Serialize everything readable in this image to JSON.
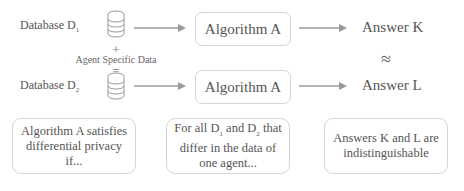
{
  "diagram": {
    "row1": {
      "database_label": "Database D",
      "database_sub": "1",
      "algorithm_label": "Algorithm A",
      "answer_label": "Answer K"
    },
    "middle": {
      "plus": "+",
      "agent_data_label": "Agent Specific Data",
      "equals": "="
    },
    "row2": {
      "database_label": "Database D",
      "database_sub": "2",
      "algorithm_label": "Algorithm A",
      "answer_label": "Answer L"
    },
    "approx_symbol": "≈",
    "notes": {
      "left": "Algorithm A satisfies differential privacy if...",
      "middle_part1": "For all D",
      "middle_sub1": "1",
      "middle_part2": " and D",
      "middle_sub2": "2",
      "middle_part3": " that differ in the data of one agent...",
      "right": "Answers K and L are indistinguishable"
    },
    "colors": {
      "arrow": "#9a9a9a",
      "box_border": "#d4d4d4",
      "text": "#555555"
    },
    "icons": [
      "database-icon",
      "arrow-right-icon"
    ]
  }
}
